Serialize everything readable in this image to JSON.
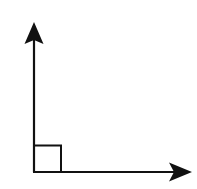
{
  "diagram": {
    "type": "right-angle",
    "stroke_color": "#111111",
    "background_color": "#ffffff",
    "vertex": {
      "x": 34,
      "y": 172
    },
    "rays": [
      {
        "name": "vertical-ray",
        "direction": "up",
        "end": {
          "x": 34,
          "y": 22
        }
      },
      {
        "name": "horizontal-ray",
        "direction": "right",
        "end": {
          "x": 192,
          "y": 172
        }
      }
    ],
    "right_angle_marker": {
      "size": 27
    }
  }
}
